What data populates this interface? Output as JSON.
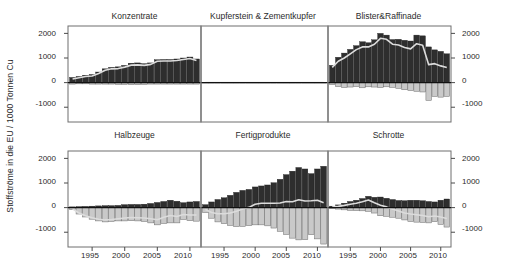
{
  "figure": {
    "ylabel": "Stoffströme in die EU / 1000 Tonnen Cu",
    "y_ticks": [
      "2000",
      "1000",
      "0",
      "-1000"
    ],
    "x_ticks": [
      "1995",
      "2000",
      "2005",
      "2010"
    ],
    "panel_titles": {
      "p1": "Konzentrate",
      "p2": "Kupferstein & Zementkupfer",
      "p3": "Blister&Raffinade",
      "p4": "Halbzeuge",
      "p5": "Fertigprodukte",
      "p6": "Schrotte"
    },
    "colors": {
      "import_bar": "#2e2e2e",
      "export_bar": "#c9c9c9",
      "net_line": "#dcdcdc",
      "frame": "#6e6e6e",
      "zero_line": "#111111",
      "text": "#2b2b2b",
      "background": "#ffffff"
    }
  },
  "chart_data": {
    "type": "bar",
    "title": "",
    "xlabel": "",
    "ylabel": "Stoffströme in die EU / 1000 Tonnen Cu",
    "ylim": [
      -1600,
      2300
    ],
    "y_ticks": [
      2000,
      1000,
      0,
      -1000
    ],
    "xlim": [
      1991.3,
      2011.7
    ],
    "x_ticks": [
      1995,
      2000,
      2005,
      2010
    ],
    "grid": false,
    "legend": "none",
    "layout": "2 rows x 3 columns of panels",
    "x": [
      1992,
      1993,
      1994,
      1995,
      1996,
      1997,
      1998,
      1999,
      2000,
      2001,
      2002,
      2003,
      2004,
      2005,
      2006,
      2007,
      2008,
      2009,
      2010,
      2011
    ],
    "panels": [
      {
        "id": "p1",
        "title": "Konzentrate",
        "row": 1,
        "col": 1,
        "series": [
          {
            "name": "Import",
            "values": [
              210,
              250,
              300,
              330,
              430,
              560,
              620,
              640,
              700,
              790,
              800,
              770,
              800,
              930,
              940,
              940,
              960,
              1000,
              1040,
              960
            ]
          },
          {
            "name": "Export",
            "values": [
              -60,
              -50,
              -50,
              -60,
              -60,
              -60,
              -60,
              -70,
              -70,
              -80,
              -80,
              -70,
              -60,
              -60,
              -60,
              -60,
              -60,
              -60,
              -60,
              -60
            ]
          },
          {
            "name": "Netto",
            "values": [
              150,
              200,
              250,
              270,
              370,
              500,
              560,
              570,
              630,
              710,
              720,
              700,
              740,
              870,
              880,
              880,
              900,
              940,
              980,
              900
            ]
          }
        ]
      },
      {
        "id": "p2",
        "title": "Kupferstein & Zementkupfer",
        "row": 1,
        "col": 2,
        "series": [
          {
            "name": "Import",
            "values": [
              10,
              10,
              10,
              10,
              12,
              12,
              12,
              10,
              10,
              8,
              8,
              8,
              8,
              8,
              8,
              8,
              8,
              8,
              8,
              8
            ]
          },
          {
            "name": "Export",
            "values": [
              -5,
              -5,
              -5,
              -5,
              -6,
              -6,
              -6,
              -5,
              -5,
              -4,
              -4,
              -4,
              -4,
              -4,
              -4,
              -4,
              -4,
              -4,
              -4,
              -4
            ]
          },
          {
            "name": "Netto",
            "values": [
              5,
              5,
              5,
              5,
              6,
              6,
              6,
              5,
              5,
              4,
              4,
              4,
              4,
              4,
              4,
              4,
              4,
              4,
              4,
              4
            ]
          }
        ]
      },
      {
        "id": "p3",
        "title": "Blister&Raffinade",
        "row": 1,
        "col": 3,
        "series": [
          {
            "name": "Import",
            "values": [
              700,
              1030,
              1200,
              1350,
              1500,
              1660,
              1620,
              1740,
              2000,
              1930,
              1750,
              1760,
              1720,
              1690,
              1930,
              1900,
              1450,
              1330,
              1270,
              1170
            ]
          },
          {
            "name": "Export",
            "values": [
              -80,
              -160,
              -200,
              -180,
              -160,
              -210,
              -170,
              -180,
              -200,
              -170,
              -190,
              -230,
              -290,
              -320,
              -350,
              -380,
              -720,
              -560,
              -590,
              -560
            ]
          },
          {
            "name": "Netto",
            "values": [
              620,
              870,
              1000,
              1170,
              1340,
              1450,
              1450,
              1560,
              1800,
              1760,
              1560,
              1530,
              1430,
              1370,
              1580,
              1520,
              730,
              770,
              680,
              610
            ]
          }
        ]
      },
      {
        "id": "p4",
        "title": "Halbzeuge",
        "row": 2,
        "col": 1,
        "series": [
          {
            "name": "Import",
            "values": [
              30,
              40,
              50,
              60,
              70,
              80,
              80,
              90,
              120,
              130,
              130,
              140,
              170,
              210,
              250,
              300,
              260,
              200,
              230,
              250
            ]
          },
          {
            "name": "Export",
            "values": [
              -80,
              -260,
              -380,
              -470,
              -540,
              -580,
              -560,
              -540,
              -540,
              -530,
              -540,
              -560,
              -620,
              -700,
              -640,
              -620,
              -620,
              -480,
              -530,
              -550
            ]
          },
          {
            "name": "Netto",
            "values": [
              -50,
              -220,
              -330,
              -410,
              -470,
              -500,
              -480,
              -450,
              -420,
              -400,
              -410,
              -420,
              -450,
              -490,
              -390,
              -320,
              -360,
              -280,
              -300,
              -300
            ]
          }
        ]
      },
      {
        "id": "p5",
        "title": "Fertigprodukte",
        "row": 2,
        "col": 2,
        "series": [
          {
            "name": "Import",
            "values": [
              120,
              230,
              330,
              400,
              500,
              620,
              700,
              740,
              840,
              880,
              920,
              1010,
              1150,
              1340,
              1480,
              1630,
              1570,
              1380,
              1570,
              1680
            ]
          },
          {
            "name": "Export",
            "values": [
              -200,
              -430,
              -580,
              -650,
              -720,
              -770,
              -760,
              -730,
              -700,
              -700,
              -740,
              -830,
              -960,
              -1090,
              -1240,
              -1310,
              -1300,
              -1100,
              -1270,
              -1480
            ]
          },
          {
            "name": "Netto",
            "values": [
              -80,
              -200,
              -250,
              -250,
              -220,
              -150,
              -60,
              10,
              140,
              180,
              180,
              180,
              190,
              250,
              240,
              320,
              270,
              280,
              300,
              200
            ]
          }
        ]
      },
      {
        "id": "p6",
        "title": "Schrotte",
        "row": 2,
        "col": 3,
        "series": [
          {
            "name": "Import",
            "values": [
              60,
              110,
              180,
              250,
              300,
              370,
              460,
              420,
              430,
              380,
              330,
              290,
              280,
              300,
              300,
              280,
              250,
              230,
              300,
              350
            ]
          },
          {
            "name": "Export",
            "values": [
              -40,
              -60,
              -90,
              -110,
              -120,
              -130,
              -150,
              -220,
              -330,
              -350,
              -390,
              -430,
              -500,
              -560,
              -590,
              -600,
              -620,
              -570,
              -680,
              -790
            ]
          },
          {
            "name": "Netto",
            "values": [
              20,
              50,
              90,
              140,
              180,
              240,
              310,
              200,
              100,
              30,
              -60,
              -140,
              -220,
              -260,
              -290,
              -320,
              -370,
              -340,
              -380,
              -440
            ]
          }
        ]
      }
    ]
  }
}
